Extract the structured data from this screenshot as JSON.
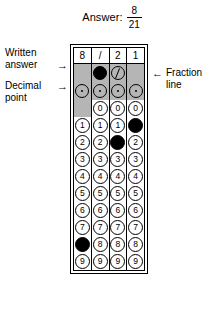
{
  "header": {
    "answer_label": "Answer:",
    "fraction_numerator": "8",
    "fraction_denominator": "21"
  },
  "annotations": {
    "written_answer": {
      "line1": "Written",
      "line2": "answer",
      "arrow": "→"
    },
    "decimal_point": {
      "line1": "Decimal",
      "line2": "point",
      "arrow": "→"
    },
    "fraction_line": {
      "line1": "Fraction",
      "line2": "line",
      "arrow": "←"
    }
  },
  "grid": {
    "columns": 4,
    "written_answer_row": [
      "8",
      "/",
      "2",
      "1"
    ],
    "fraction_line_row": {
      "row_label": "/",
      "cells": [
        {
          "present": false,
          "glyph": "",
          "filled": false
        },
        {
          "present": true,
          "glyph": "/",
          "filled": true
        },
        {
          "present": true,
          "glyph": "/",
          "filled": false
        },
        {
          "present": false,
          "glyph": "",
          "filled": false
        }
      ]
    },
    "decimal_point_row": {
      "row_label": ".",
      "cells": [
        {
          "present": true,
          "glyph": ".",
          "filled": false
        },
        {
          "present": true,
          "glyph": ".",
          "filled": false
        },
        {
          "present": true,
          "glyph": ".",
          "filled": false
        },
        {
          "present": true,
          "glyph": ".",
          "filled": false
        }
      ]
    },
    "digit_rows": [
      {
        "row_label": "0",
        "cells": [
          {
            "present": false,
            "glyph": "0",
            "filled": false
          },
          {
            "present": true,
            "glyph": "0",
            "filled": false
          },
          {
            "present": true,
            "glyph": "0",
            "filled": false
          },
          {
            "present": true,
            "glyph": "0",
            "filled": false
          }
        ]
      },
      {
        "row_label": "1",
        "cells": [
          {
            "present": true,
            "glyph": "1",
            "filled": false
          },
          {
            "present": true,
            "glyph": "1",
            "filled": false
          },
          {
            "present": true,
            "glyph": "1",
            "filled": false
          },
          {
            "present": true,
            "glyph": "1",
            "filled": true
          }
        ]
      },
      {
        "row_label": "2",
        "cells": [
          {
            "present": true,
            "glyph": "2",
            "filled": false
          },
          {
            "present": true,
            "glyph": "2",
            "filled": false
          },
          {
            "present": true,
            "glyph": "2",
            "filled": true
          },
          {
            "present": true,
            "glyph": "2",
            "filled": false
          }
        ]
      },
      {
        "row_label": "3",
        "cells": [
          {
            "present": true,
            "glyph": "3",
            "filled": false
          },
          {
            "present": true,
            "glyph": "3",
            "filled": false
          },
          {
            "present": true,
            "glyph": "3",
            "filled": false
          },
          {
            "present": true,
            "glyph": "3",
            "filled": false
          }
        ]
      },
      {
        "row_label": "4",
        "cells": [
          {
            "present": true,
            "glyph": "4",
            "filled": false
          },
          {
            "present": true,
            "glyph": "4",
            "filled": false
          },
          {
            "present": true,
            "glyph": "4",
            "filled": false
          },
          {
            "present": true,
            "glyph": "4",
            "filled": false
          }
        ]
      },
      {
        "row_label": "5",
        "cells": [
          {
            "present": true,
            "glyph": "5",
            "filled": false
          },
          {
            "present": true,
            "glyph": "5",
            "filled": false
          },
          {
            "present": true,
            "glyph": "5",
            "filled": false
          },
          {
            "present": true,
            "glyph": "5",
            "filled": false
          }
        ]
      },
      {
        "row_label": "6",
        "cells": [
          {
            "present": true,
            "glyph": "6",
            "filled": false
          },
          {
            "present": true,
            "glyph": "6",
            "filled": false
          },
          {
            "present": true,
            "glyph": "6",
            "filled": false
          },
          {
            "present": true,
            "glyph": "6",
            "filled": false
          }
        ]
      },
      {
        "row_label": "7",
        "cells": [
          {
            "present": true,
            "glyph": "7",
            "filled": false
          },
          {
            "present": true,
            "glyph": "7",
            "filled": false
          },
          {
            "present": true,
            "glyph": "7",
            "filled": false
          },
          {
            "present": true,
            "glyph": "7",
            "filled": false
          }
        ]
      },
      {
        "row_label": "8",
        "cells": [
          {
            "present": true,
            "glyph": "8",
            "filled": true
          },
          {
            "present": true,
            "glyph": "8",
            "filled": false
          },
          {
            "present": true,
            "glyph": "8",
            "filled": false
          },
          {
            "present": true,
            "glyph": "8",
            "filled": false
          }
        ]
      },
      {
        "row_label": "9",
        "cells": [
          {
            "present": true,
            "glyph": "9",
            "filled": false
          },
          {
            "present": true,
            "glyph": "9",
            "filled": false
          },
          {
            "present": true,
            "glyph": "9",
            "filled": false
          },
          {
            "present": true,
            "glyph": "9",
            "filled": false
          }
        ]
      }
    ]
  },
  "colors": {
    "ink": "#000000",
    "shaded_cell": "#b5b5b5",
    "paper": "#ffffff"
  }
}
